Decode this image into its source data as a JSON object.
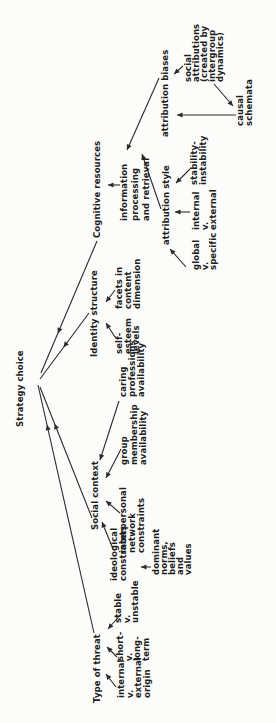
{
  "figure": {
    "type": "concept-tree-diagram",
    "root_label": "Strategy choice",
    "orientation": "rotated -90deg (text reads bottom-to-top in portrait frame)",
    "colors": {
      "ink": "#1e1e1e",
      "line": "#2b2b2b",
      "background": "#fcfcfb"
    }
  },
  "nodes": [
    {
      "id": "strategy-choice",
      "lines": [
        "Strategy choice"
      ],
      "x": 296,
      "y": 17,
      "lh": 8.5
    },
    {
      "id": "type-of-threat",
      "lines": [
        "Type of threat"
      ],
      "x": 20,
      "y": 94,
      "lh": 8.5
    },
    {
      "id": "internal-external-origin",
      "lines": [
        "internal",
        "v.",
        "external",
        "origin"
      ],
      "x": 25,
      "y": 118,
      "lh": 8.5
    },
    {
      "id": "short-long-term",
      "lines": [
        "short-",
        "v.",
        "long-",
        "term"
      ],
      "x": 62,
      "y": 117,
      "lh": 8.5
    },
    {
      "id": "stable-unstable",
      "lines": [
        "stable",
        "v.",
        "unstable"
      ],
      "x": 100,
      "y": 115,
      "lh": 8.5
    },
    {
      "id": "social-context",
      "lines": [
        "Social context"
      ],
      "x": 193,
      "y": 92,
      "lh": 8.5
    },
    {
      "id": "ideological-constraints",
      "lines": [
        "ideological",
        "constraints"
      ],
      "x": 142,
      "y": 111,
      "lh": 9
    },
    {
      "id": "dominant-norms",
      "lines": [
        "dominant",
        "norms,",
        "beliefs",
        "and",
        "values"
      ],
      "x": 148,
      "y": 153,
      "lh": 8
    },
    {
      "id": "interpersonal-network",
      "lines": [
        "interpersonal",
        "network",
        "constraints"
      ],
      "x": 170,
      "y": 120,
      "lh": 9
    },
    {
      "id": "group-membership",
      "lines": [
        "group",
        "membership",
        "availability"
      ],
      "x": 258,
      "y": 121,
      "lh": 9.5
    },
    {
      "id": "caring-professions",
      "lines": [
        "caring",
        "professions",
        "availability"
      ],
      "x": 326,
      "y": 120,
      "lh": 9
    },
    {
      "id": "identity-structure",
      "lines": [
        "Identity structure"
      ],
      "x": 366,
      "y": 91,
      "lh": 8.5
    },
    {
      "id": "self-esteem-levels",
      "lines": [
        "self-",
        "esteem",
        "levels"
      ],
      "x": 369,
      "y": 116,
      "lh": 8.5
    },
    {
      "id": "facets-content-dimension",
      "lines": [
        "facets in",
        "content",
        "dimension"
      ],
      "x": 414,
      "y": 116,
      "lh": 9
    },
    {
      "id": "cognitive-resources",
      "lines": [
        "Cognitive resources"
      ],
      "x": 485,
      "y": 94,
      "lh": 8.5
    },
    {
      "id": "information-processing",
      "lines": [
        "information",
        "processing",
        "and retrieval"
      ],
      "x": 502,
      "y": 120,
      "lh": 11
    },
    {
      "id": "attribution-style",
      "lines": [
        "attribution style"
      ],
      "x": 478,
      "y": 163,
      "lh": 8.5
    },
    {
      "id": "global-specific",
      "lines": [
        "global",
        "v.",
        "specific"
      ],
      "x": 453,
      "y": 193,
      "lh": 8.5
    },
    {
      "id": "internal-external",
      "lines": [
        "internal",
        "v.",
        "external"
      ],
      "x": 493,
      "y": 193,
      "lh": 8.5
    },
    {
      "id": "stability-instability",
      "lines": [
        "stability-",
        "instability"
      ],
      "x": 538,
      "y": 191,
      "lh": 8.5
    },
    {
      "id": "attribution-biases",
      "lines": [
        "attribution biases"
      ],
      "x": 586,
      "y": 162,
      "lh": 8.5
    },
    {
      "id": "social-attributions",
      "lines": [
        "social",
        "attributions",
        "(created by",
        "intergroup",
        "dynamics)"
      ],
      "x": 641,
      "y": 185,
      "lh": 8
    },
    {
      "id": "causal-schemata",
      "lines": [
        "causal",
        "schemata"
      ],
      "x": 597,
      "y": 237,
      "lh": 9
    }
  ],
  "arrows": [
    {
      "from": "type-of-threat",
      "to": "strategy-choice",
      "x1": 90,
      "y1": 94,
      "x2": 338,
      "y2": 38,
      "t": 0.84
    },
    {
      "from": "social-context",
      "to": "strategy-choice",
      "x1": 205,
      "y1": 92,
      "x2": 336,
      "y2": 40,
      "t": 0.72
    },
    {
      "from": "identity-structure",
      "to": "strategy-choice",
      "x1": 410,
      "y1": 89,
      "x2": 344,
      "y2": 40,
      "t": 0.52
    },
    {
      "from": "cognitive-resources",
      "to": "strategy-choice",
      "x1": 482,
      "y1": 97,
      "x2": 350,
      "y2": 41,
      "t": 0.7
    },
    {
      "from": "internal-external-origin",
      "to": "type-of-threat",
      "x1": 36,
      "y1": 116,
      "x2": 49,
      "y2": 106,
      "t": 1
    },
    {
      "from": "short-long-term",
      "to": "type-of-threat",
      "x1": 66,
      "y1": 117,
      "x2": 76,
      "y2": 107,
      "t": 1
    },
    {
      "from": "stable-unstable",
      "to": "type-of-threat",
      "x1": 109,
      "y1": 121,
      "x2": 94,
      "y2": 108,
      "t": 1
    },
    {
      "from": "ideological-constraints",
      "to": "social-context",
      "x1": 174,
      "y1": 113,
      "x2": 201,
      "y2": 102,
      "t": 1
    },
    {
      "from": "dominant-norms",
      "to": "ideological-constraints",
      "x1": 156,
      "y1": 151,
      "x2": 156,
      "y2": 141,
      "t": 1
    },
    {
      "from": "interpersonal-network",
      "to": "social-context",
      "x1": 210,
      "y1": 120,
      "x2": 222,
      "y2": 106,
      "t": 1
    },
    {
      "from": "group-membership",
      "to": "social-context",
      "x1": 274,
      "y1": 121,
      "x2": 245,
      "y2": 106,
      "t": 1
    },
    {
      "from": "caring-professions",
      "to": "social-context",
      "x1": 322,
      "y1": 119,
      "x2": 263,
      "y2": 100,
      "t": 1
    },
    {
      "from": "self-esteem-levels",
      "to": "identity-structure",
      "x1": 386,
      "y1": 115,
      "x2": 400,
      "y2": 106,
      "t": 1
    },
    {
      "from": "facets-content-dimension",
      "to": "identity-structure",
      "x1": 433,
      "y1": 115,
      "x2": 421,
      "y2": 106,
      "t": 1
    },
    {
      "from": "information-processing",
      "to": "cognitive-resources",
      "x1": 538,
      "y1": 120,
      "x2": 538,
      "y2": 108,
      "t": 1
    },
    {
      "from": "attribution-style",
      "to": "information-processing",
      "x1": 514,
      "y1": 161,
      "x2": 569,
      "y2": 142,
      "t": 1
    },
    {
      "from": "attribution-biases",
      "to": "information-processing",
      "x1": 645,
      "y1": 159,
      "x2": 573,
      "y2": 127,
      "t": 1
    },
    {
      "from": "global-specific",
      "to": "attribution-style",
      "x1": 456,
      "y1": 186,
      "x2": 474,
      "y2": 170,
      "t": 1
    },
    {
      "from": "internal-external",
      "to": "attribution-style",
      "x1": 511,
      "y1": 190,
      "x2": 511,
      "y2": 175,
      "t": 1
    },
    {
      "from": "stability-instability",
      "to": "attribution-style",
      "x1": 554,
      "y1": 190,
      "x2": 540,
      "y2": 176,
      "t": 1
    },
    {
      "from": "social-attributions",
      "to": "attribution-biases",
      "x1": 657,
      "y1": 183,
      "x2": 649,
      "y2": 174,
      "t": 1
    },
    {
      "from": "causal-schemata",
      "to": "attribution-biases",
      "x1": 608,
      "y1": 236,
      "x2": 608,
      "y2": 177,
      "t": 1
    },
    {
      "from": "social-attributions",
      "to": "causal-schemata",
      "x1": 639,
      "y1": 214,
      "x2": 617,
      "y2": 233,
      "t": 1
    }
  ]
}
